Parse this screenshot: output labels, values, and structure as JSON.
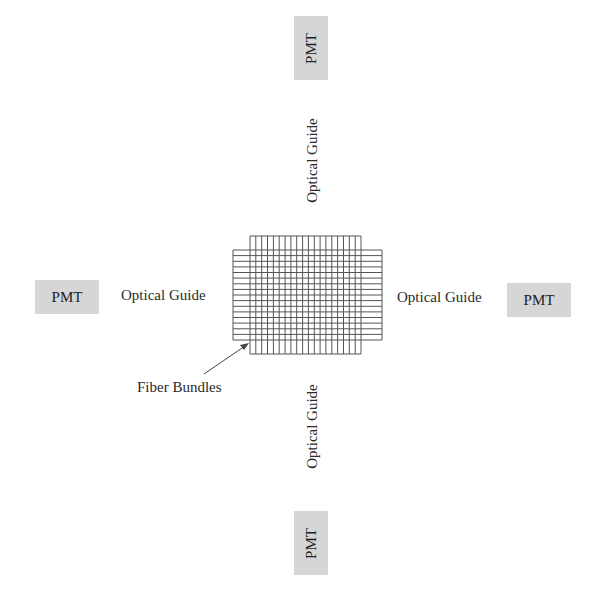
{
  "diagram": {
    "center": {
      "label": "Fiber Bundles",
      "grid": {
        "vertical_lines": 20,
        "horizontal_lines": 17
      }
    },
    "top": {
      "guide_label": "Optical Guide",
      "detector_label": "PMT"
    },
    "bottom": {
      "guide_label": "Optical Guide",
      "detector_label": "PMT"
    },
    "left": {
      "guide_label": "Optical Guide",
      "detector_label": "PMT"
    },
    "right": {
      "guide_label": "Optical Guide",
      "detector_label": "PMT"
    },
    "colors": {
      "pmt_fill": "#d6d6d6",
      "grid_line": "#555555",
      "text": "#2a2a2a"
    }
  }
}
